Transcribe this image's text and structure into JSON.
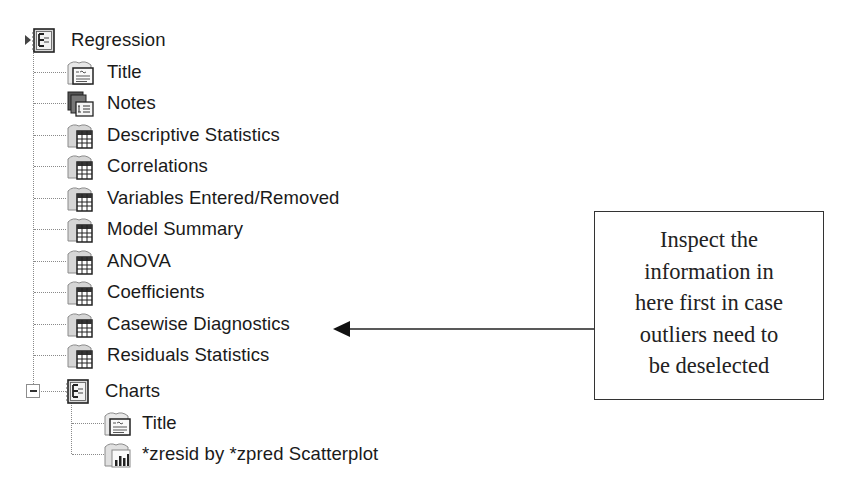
{
  "tree": {
    "root": {
      "label": "Regression",
      "icon": "output-book-icon",
      "expanded": true,
      "children": [
        {
          "label": "Title",
          "icon": "title-page-icon"
        },
        {
          "label": "Notes",
          "icon": "notes-icon"
        },
        {
          "label": "Descriptive Statistics",
          "icon": "pivot-table-icon"
        },
        {
          "label": "Correlations",
          "icon": "pivot-table-icon"
        },
        {
          "label": "Variables Entered/Removed",
          "icon": "pivot-table-icon"
        },
        {
          "label": "Model Summary",
          "icon": "pivot-table-icon"
        },
        {
          "label": "ANOVA",
          "icon": "pivot-table-icon"
        },
        {
          "label": "Coefficients",
          "icon": "pivot-table-icon"
        },
        {
          "label": "Casewise Diagnostics",
          "icon": "pivot-table-icon"
        },
        {
          "label": "Residuals Statistics",
          "icon": "pivot-table-icon"
        }
      ]
    },
    "charts": {
      "label": "Charts",
      "icon": "output-book-icon",
      "expanded": true,
      "expander_symbol": "−",
      "children": [
        {
          "label": "Title",
          "icon": "title-page-icon"
        },
        {
          "label": "*zresid by *zpred Scatterplot",
          "icon": "chart-icon"
        }
      ]
    }
  },
  "callout": {
    "lines": [
      "Inspect the",
      "information in",
      "here first in case",
      "outliers need to",
      "be deselected"
    ],
    "points_to": "Casewise Diagnostics"
  },
  "colors": {
    "text": "#1a1a1a",
    "tree_lines": "#8a8a8a",
    "callout_border": "#333333",
    "background": "#ffffff"
  }
}
